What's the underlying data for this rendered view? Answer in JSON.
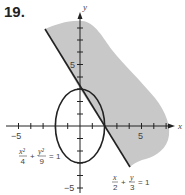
{
  "problem_number": "19.",
  "axes": {
    "x_label": "x",
    "y_label": "y",
    "x_tick_label_neg": "−5",
    "x_tick_label_pos": "5",
    "y_tick_label_pos": "5",
    "y_tick_label_neg": "−5"
  },
  "curves": {
    "ellipse": {
      "equation": "x²/4 + y²/9 = 1",
      "num1": "x²",
      "den1": "4",
      "num2": "y²",
      "den2": "9",
      "plus": "+",
      "eq": "= 1"
    },
    "line": {
      "equation": "x/2 + y/3 = 1",
      "num1": "x",
      "den1": "2",
      "num2": "y",
      "den2": "3",
      "plus": "+",
      "eq": "= 1"
    }
  },
  "colors": {
    "shade": "#c8c8c8",
    "stroke": "#222222"
  }
}
